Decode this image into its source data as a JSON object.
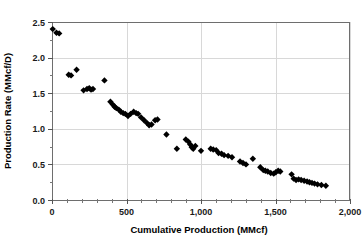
{
  "chart_data": {
    "type": "scatter",
    "title": "",
    "xlabel": "Cumulative Production (MMcf)",
    "ylabel": "Production Rate (MMcf/D)",
    "xlim": [
      0,
      2000
    ],
    "ylim": [
      0,
      2.5
    ],
    "xticks": [
      "0",
      "500",
      "1,000",
      "1,500",
      "2,000"
    ],
    "xtick_values": [
      0,
      500,
      1000,
      1500,
      2000
    ],
    "yticks": [
      "0.0",
      "0.5",
      "1.0",
      "1.5",
      "2.0",
      "2.5"
    ],
    "ytick_values": [
      0.0,
      0.5,
      1.0,
      1.5,
      2.0,
      2.5
    ],
    "grid": true,
    "legend": null,
    "marker": "diamond",
    "marker_color": "#000000",
    "series": [
      {
        "name": "Production Rate vs Cumulative Production",
        "points": [
          [
            5,
            2.4
          ],
          [
            30,
            2.35
          ],
          [
            48,
            2.34
          ],
          [
            112,
            1.76
          ],
          [
            128,
            1.75
          ],
          [
            165,
            1.83
          ],
          [
            212,
            1.54
          ],
          [
            235,
            1.56
          ],
          [
            250,
            1.57
          ],
          [
            262,
            1.55
          ],
          [
            275,
            1.56
          ],
          [
            352,
            1.68
          ],
          [
            392,
            1.38
          ],
          [
            408,
            1.34
          ],
          [
            420,
            1.31
          ],
          [
            432,
            1.29
          ],
          [
            448,
            1.27
          ],
          [
            462,
            1.24
          ],
          [
            478,
            1.22
          ],
          [
            492,
            1.21
          ],
          [
            510,
            1.18
          ],
          [
            528,
            1.21
          ],
          [
            548,
            1.24
          ],
          [
            565,
            1.22
          ],
          [
            578,
            1.21
          ],
          [
            598,
            1.16
          ],
          [
            618,
            1.12
          ],
          [
            638,
            1.08
          ],
          [
            652,
            1.05
          ],
          [
            668,
            1.06
          ],
          [
            692,
            1.12
          ],
          [
            708,
            1.13
          ],
          [
            768,
            0.92
          ],
          [
            838,
            0.72
          ],
          [
            898,
            0.85
          ],
          [
            915,
            0.82
          ],
          [
            928,
            0.78
          ],
          [
            938,
            0.74
          ],
          [
            948,
            0.72
          ],
          [
            962,
            0.76
          ],
          [
            1000,
            0.69
          ],
          [
            1065,
            0.72
          ],
          [
            1082,
            0.71
          ],
          [
            1102,
            0.7
          ],
          [
            1118,
            0.66
          ],
          [
            1138,
            0.65
          ],
          [
            1155,
            0.63
          ],
          [
            1182,
            0.62
          ],
          [
            1208,
            0.6
          ],
          [
            1262,
            0.54
          ],
          [
            1282,
            0.52
          ],
          [
            1302,
            0.5
          ],
          [
            1348,
            0.58
          ],
          [
            1398,
            0.46
          ],
          [
            1418,
            0.42
          ],
          [
            1432,
            0.41
          ],
          [
            1448,
            0.4
          ],
          [
            1468,
            0.38
          ],
          [
            1488,
            0.37
          ],
          [
            1502,
            0.39
          ],
          [
            1518,
            0.41
          ],
          [
            1532,
            0.4
          ],
          [
            1608,
            0.36
          ],
          [
            1622,
            0.3
          ],
          [
            1638,
            0.28
          ],
          [
            1655,
            0.29
          ],
          [
            1672,
            0.28
          ],
          [
            1692,
            0.27
          ],
          [
            1712,
            0.26
          ],
          [
            1728,
            0.25
          ],
          [
            1745,
            0.24
          ],
          [
            1762,
            0.23
          ],
          [
            1782,
            0.22
          ],
          [
            1808,
            0.21
          ],
          [
            1838,
            0.2
          ]
        ]
      }
    ]
  }
}
